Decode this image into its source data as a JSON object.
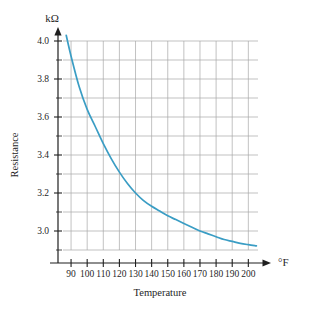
{
  "chart_data": {
    "type": "line",
    "title": "",
    "xlabel": "Temperature",
    "ylabel": "Resistance",
    "x_unit": "°F",
    "y_unit": "kΩ",
    "xlim": [
      80,
      205
    ],
    "ylim": [
      2.88,
      4.05
    ],
    "grid": true,
    "legend": "none",
    "line_color": "#3a9dc4",
    "grid_color": "#a8a8a8",
    "axis_color": "#1f1f1f",
    "xticks": [
      90,
      100,
      110,
      120,
      130,
      140,
      150,
      160,
      170,
      180,
      190,
      200
    ],
    "xtick_labels": [
      "90",
      "100",
      "110",
      "120",
      "130",
      "140",
      "150",
      "160",
      "170",
      "180",
      "190",
      "200"
    ],
    "yticks": [
      3.0,
      3.2,
      3.4,
      3.6,
      3.8,
      4.0
    ],
    "ytick_labels": [
      "3.0",
      "3.2",
      "3.4",
      "3.6",
      "3.8",
      "4.0"
    ],
    "y_minor_ticks": [
      2.9,
      3.1,
      3.3,
      3.5,
      3.7,
      3.9
    ],
    "series": [
      {
        "name": "Thermistor resistance",
        "x": [
          87,
          90,
          95,
          100,
          105,
          110,
          115,
          120,
          125,
          130,
          135,
          140,
          145,
          150,
          155,
          160,
          165,
          170,
          175,
          180,
          185,
          190,
          195,
          200,
          205
        ],
        "y": [
          4.03,
          3.92,
          3.76,
          3.64,
          3.55,
          3.46,
          3.38,
          3.31,
          3.25,
          3.2,
          3.16,
          3.13,
          3.105,
          3.08,
          3.06,
          3.04,
          3.02,
          3.0,
          2.985,
          2.97,
          2.955,
          2.945,
          2.935,
          2.928,
          2.922
        ]
      }
    ]
  },
  "labels": {
    "y_axis_unit": "kΩ",
    "x_axis_unit": "°F",
    "y_axis_title": "Resistance",
    "x_axis_title": "Temperature"
  }
}
